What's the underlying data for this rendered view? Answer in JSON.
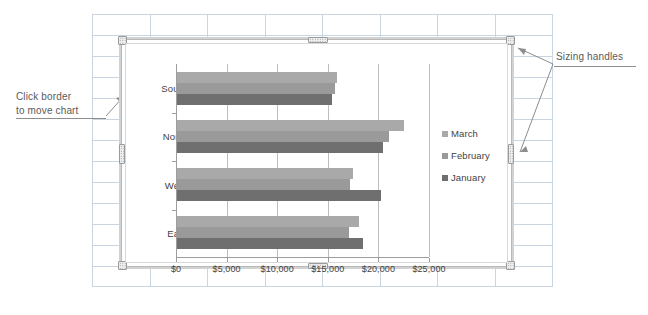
{
  "document": {
    "type": "spreadsheet-with-embedded-chart",
    "background": "#ffffff",
    "gridline_color": "#c9d6e2"
  },
  "annotations": [
    {
      "id": "move",
      "text_line1": "Click border",
      "text_line2": "to move chart",
      "target": "chart-left-border"
    },
    {
      "id": "sizing",
      "text": "Sizing handles",
      "target": "chart-corner-handles"
    }
  ],
  "chart_object": {
    "selected": true,
    "handles": [
      "top-left",
      "top-center",
      "top-right",
      "middle-left",
      "middle-right",
      "bottom-left",
      "bottom-center",
      "bottom-right"
    ]
  },
  "chart_data": {
    "type": "bar",
    "orientation": "horizontal",
    "title": "",
    "xlabel": "",
    "ylabel": "",
    "categories": [
      "South",
      "North",
      "West",
      "East"
    ],
    "series": [
      {
        "name": "March",
        "color": "#a9a9a9",
        "values": [
          15800,
          22400,
          17400,
          18000
        ]
      },
      {
        "name": "February",
        "color": "#9a9a9a",
        "values": [
          15600,
          20900,
          17100,
          17000
        ]
      },
      {
        "name": "January",
        "color": "#6f6f6f",
        "values": [
          15300,
          20400,
          20200,
          18400
        ]
      }
    ],
    "series_plot_order_top_to_bottom": [
      "March",
      "February",
      "January"
    ],
    "legend_entries": [
      "March",
      "February",
      "January"
    ],
    "legend_position": "right",
    "xlim": [
      0,
      25000
    ],
    "xticks": [
      0,
      5000,
      10000,
      15000,
      20000,
      25000
    ],
    "xtick_labels": [
      "$0",
      "$5,000",
      "$10,000",
      "$15,000",
      "$20,000",
      "$25,000"
    ],
    "grid": "vertical-only",
    "value_prefix": "$"
  }
}
